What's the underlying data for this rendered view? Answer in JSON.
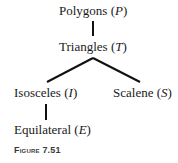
{
  "diagram": {
    "type": "tree",
    "nodes": [
      {
        "id": "P",
        "name": "Polygons",
        "symbol": "P"
      },
      {
        "id": "T",
        "name": "Triangles",
        "symbol": "T"
      },
      {
        "id": "I",
        "name": "Isosceles",
        "symbol": "I"
      },
      {
        "id": "S",
        "name": "Scalene",
        "symbol": "S"
      },
      {
        "id": "E",
        "name": "Equilateral",
        "symbol": "E"
      }
    ],
    "edges": [
      {
        "from": "P",
        "to": "T"
      },
      {
        "from": "T",
        "to": "I"
      },
      {
        "from": "T",
        "to": "S"
      },
      {
        "from": "I",
        "to": "E"
      }
    ],
    "line_color": "#111111"
  },
  "labels": {
    "polygons": {
      "name": "Polygons",
      "open": " (",
      "symbol": "P",
      "close": ")"
    },
    "triangles": {
      "name": "Triangles",
      "open": " (",
      "symbol": "T",
      "close": ")"
    },
    "isosceles": {
      "name": "Isosceles",
      "open": " (",
      "symbol": "I",
      "close": ")"
    },
    "scalene": {
      "name": "Scalene",
      "open": " (",
      "symbol": "S",
      "close": ")"
    },
    "equilateral": {
      "name": "Equilateral",
      "open": " (",
      "symbol": "E",
      "close": ")"
    }
  },
  "caption": "Figure 7.51"
}
